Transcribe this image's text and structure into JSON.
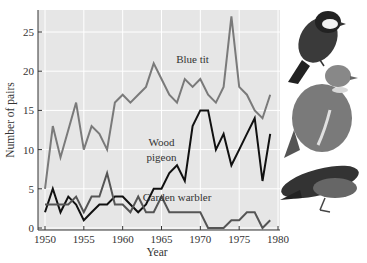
{
  "chart_data": {
    "type": "line",
    "title": "",
    "xlabel": "Year",
    "ylabel": "Number of pairs",
    "xlim": [
      1949,
      1981
    ],
    "ylim": [
      0,
      28
    ],
    "x_ticks": [
      1950,
      1955,
      1960,
      1965,
      1970,
      1975,
      1980
    ],
    "y_ticks": [
      0,
      5,
      10,
      15,
      20,
      25
    ],
    "grid": true,
    "legend": "inline annotations",
    "x": [
      1950,
      1951,
      1952,
      1953,
      1954,
      1955,
      1956,
      1957,
      1958,
      1959,
      1960,
      1961,
      1962,
      1963,
      1964,
      1965,
      1966,
      1967,
      1968,
      1969,
      1970,
      1971,
      1972,
      1973,
      1974,
      1975,
      1976,
      1977,
      1978,
      1979
    ],
    "series": [
      {
        "name": "Blue tit",
        "color": "#7a7a7a",
        "values": [
          5,
          13,
          9,
          12.5,
          16,
          10,
          13,
          12,
          10,
          16,
          17,
          16,
          17,
          18,
          21,
          19,
          17,
          16,
          19,
          18,
          19,
          17,
          16,
          18,
          27,
          18,
          17,
          15,
          14,
          17
        ]
      },
      {
        "name": "Wood pigeon",
        "color": "#111111",
        "values": [
          2,
          5,
          2,
          4,
          3,
          1,
          2,
          3,
          3,
          4,
          4,
          3,
          2,
          3,
          5,
          5,
          7,
          8,
          6,
          13,
          15,
          15,
          10,
          12,
          8,
          10,
          12,
          14,
          6,
          12
        ]
      },
      {
        "name": "Garden warbler",
        "color": "#555555",
        "values": [
          3,
          3,
          3,
          3,
          4,
          2,
          4,
          4,
          7,
          3,
          3,
          2,
          4,
          2,
          2,
          4,
          2,
          2,
          2,
          2,
          2,
          0,
          0,
          0,
          1,
          1,
          2,
          2,
          0,
          1
        ]
      }
    ],
    "annotations": [
      {
        "text": "Blue tit",
        "x": 1969,
        "y": 21
      },
      {
        "text": "Wood",
        "x": 1965,
        "y": 10.5
      },
      {
        "text": "pigeon",
        "x": 1965,
        "y": 8.5
      },
      {
        "text": "Garden warbler",
        "x": 1967,
        "y": 3.5
      }
    ]
  },
  "images": {
    "birds": [
      "blue-tit",
      "wood-pigeon",
      "garden-warbler"
    ]
  }
}
